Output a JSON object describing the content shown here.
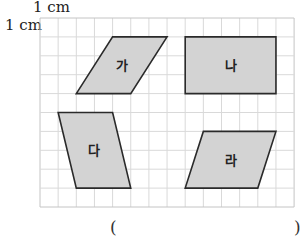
{
  "unit_labels": {
    "top": "1 cm",
    "left": "1 cm"
  },
  "grid": {
    "columns": 14,
    "rows": 10,
    "x0": 40,
    "y0": 18,
    "cell_w": 18.15,
    "cell_h": 18.9,
    "line_color": "#d9d9d9",
    "border_color": "#c4c4c4"
  },
  "shapes": [
    {
      "label": "가",
      "type": "parallelogram",
      "points": [
        [
          4,
          1
        ],
        [
          7,
          1
        ],
        [
          5,
          4
        ],
        [
          2,
          4
        ]
      ]
    },
    {
      "label": "나",
      "type": "rectangle",
      "points": [
        [
          8,
          1
        ],
        [
          13,
          1
        ],
        [
          13,
          4
        ],
        [
          8,
          4
        ]
      ]
    },
    {
      "label": "다",
      "type": "parallelogram",
      "points": [
        [
          1,
          5
        ],
        [
          4,
          5
        ],
        [
          5,
          9
        ],
        [
          2,
          9
        ]
      ]
    },
    {
      "label": "라",
      "type": "parallelogram",
      "points": [
        [
          9,
          6
        ],
        [
          13,
          6
        ],
        [
          12,
          9
        ],
        [
          8,
          9
        ]
      ]
    }
  ],
  "shape_style": {
    "fill": "#d3d3d3",
    "stroke": "#2a2a2a"
  },
  "answer": {
    "open_paren": "(",
    "close_paren": ")",
    "value": ""
  }
}
